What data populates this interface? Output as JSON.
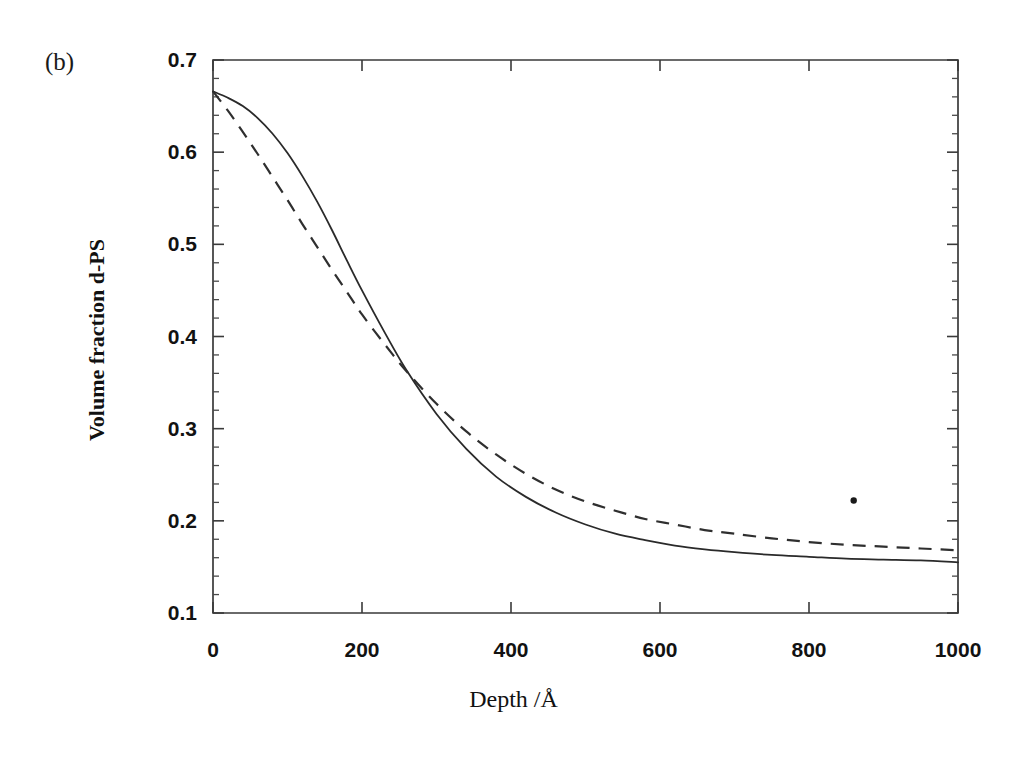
{
  "panel": {
    "label": "(b)"
  },
  "axis_titles": {
    "x": "Depth /Å",
    "y": "Volume fraction d-PS"
  },
  "ticks": {
    "y_labels": [
      "0.7",
      "0.6",
      "0.5",
      "0.4",
      "0.3",
      "0.2",
      "0.1"
    ],
    "x_labels": [
      "0",
      "200",
      "400",
      "600",
      "800",
      "1000"
    ]
  },
  "colors": {
    "axis": "#3a3a3a",
    "solid_curve": "#2a2a2a",
    "dashed_curve": "#2f2f2f",
    "background": "#ffffff",
    "text": "#121212"
  },
  "chart_data": {
    "type": "line",
    "title": "",
    "subtitle": "",
    "xlabel": "Depth /Å",
    "ylabel": "Volume fraction d-PS",
    "xlim": [
      0,
      1000
    ],
    "ylim": [
      0.1,
      0.7
    ],
    "xticks": [
      0,
      200,
      400,
      600,
      800,
      1000
    ],
    "yticks": [
      0.1,
      0.2,
      0.3,
      0.4,
      0.5,
      0.6,
      0.7
    ],
    "minor_tick_step_y": 0.02,
    "grid": false,
    "legend": null,
    "annotations": [
      {
        "text": "(b)",
        "role": "panel-label",
        "x_px": 48,
        "y_px": 52
      },
      {
        "text": "",
        "role": "scan-speck",
        "x": 860,
        "y": 0.222
      }
    ],
    "series": [
      {
        "name": "solid",
        "style": "solid",
        "x": [
          0,
          20,
          40,
          60,
          80,
          100,
          120,
          140,
          160,
          180,
          200,
          230,
          260,
          300,
          340,
          380,
          420,
          460,
          500,
          540,
          580,
          620,
          660,
          700,
          750,
          800,
          850,
          900,
          950,
          1000
        ],
        "y": [
          0.666,
          0.659,
          0.65,
          0.637,
          0.62,
          0.599,
          0.574,
          0.546,
          0.515,
          0.482,
          0.45,
          0.405,
          0.363,
          0.316,
          0.278,
          0.248,
          0.226,
          0.209,
          0.196,
          0.186,
          0.179,
          0.173,
          0.169,
          0.166,
          0.163,
          0.161,
          0.159,
          0.158,
          0.157,
          0.155
        ]
      },
      {
        "name": "dashed",
        "style": "dashed",
        "x": [
          0,
          20,
          40,
          60,
          80,
          100,
          120,
          140,
          160,
          180,
          200,
          230,
          260,
          300,
          340,
          380,
          420,
          460,
          500,
          540,
          580,
          620,
          660,
          700,
          750,
          800,
          850,
          900,
          950,
          1000
        ],
        "y": [
          0.666,
          0.645,
          0.622,
          0.598,
          0.573,
          0.548,
          0.522,
          0.497,
          0.472,
          0.448,
          0.424,
          0.392,
          0.362,
          0.327,
          0.297,
          0.272,
          0.251,
          0.234,
          0.221,
          0.211,
          0.202,
          0.196,
          0.19,
          0.186,
          0.181,
          0.177,
          0.174,
          0.172,
          0.17,
          0.168
        ]
      }
    ]
  },
  "geometry": {
    "plot_left_px": 213,
    "plot_right_px": 958,
    "plot_top_px": 60,
    "plot_bottom_px": 613
  }
}
